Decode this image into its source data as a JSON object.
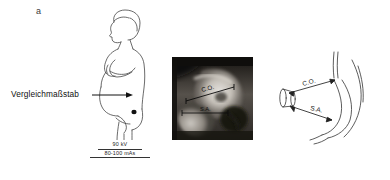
{
  "figure": {
    "panels": [
      {
        "id": "a",
        "label": "a",
        "type": "line-drawing",
        "description": "Lateral profile of pregnant patient standing, arms crossed, with reference scale marker placed on sacral region"
      },
      {
        "id": "b",
        "type": "radiograph",
        "description": "Lateral pelvimetry radiograph showing measurement lines"
      },
      {
        "id": "c",
        "type": "schematic",
        "description": "Schematic line drawing of sacrum and reference scale cylinder with measurement lines"
      }
    ]
  },
  "panel_a": {
    "label": "a",
    "callout": {
      "text": "Vergleichmaßstab",
      "arrow": "right-arrow-icon"
    },
    "exposure": {
      "kv": "90 kV",
      "mas": "80-100 mAs"
    }
  },
  "panel_b": {
    "measurements": [
      {
        "abbr": "C.O.",
        "name": "conjugata-obstetrica-line"
      },
      {
        "abbr": "S.A.",
        "name": "sagittal-outlet-line"
      }
    ]
  },
  "panel_c": {
    "measurements": [
      {
        "abbr": "C.O.",
        "name": "conjugata-obstetrica-line"
      },
      {
        "abbr": "S.A.",
        "name": "sagittal-outlet-line"
      }
    ],
    "scale_marker": "reference-scale-cylinder"
  },
  "colors": {
    "background": "#ffffff",
    "ink": "#2b2b2b",
    "text": "#111111"
  }
}
